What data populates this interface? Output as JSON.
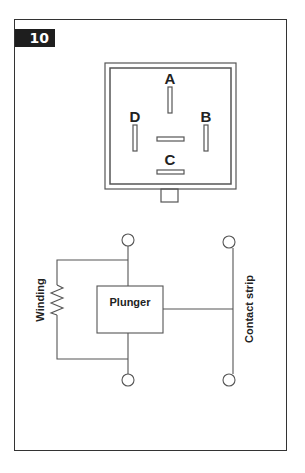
{
  "figure": {
    "number": "10"
  },
  "connector": {
    "pins": [
      {
        "label": "A",
        "orientation": "vertical"
      },
      {
        "label": "B",
        "orientation": "vertical"
      },
      {
        "label": "C",
        "orientation": "horizontal"
      },
      {
        "label": "D",
        "orientation": "vertical"
      }
    ]
  },
  "schematic": {
    "winding_label": "Winding",
    "plunger_label": "Plunger",
    "contact_label": "Contact strip"
  },
  "colors": {
    "line": "#555555",
    "badge_bg": "#1e1e1e",
    "frame": "#333333"
  }
}
